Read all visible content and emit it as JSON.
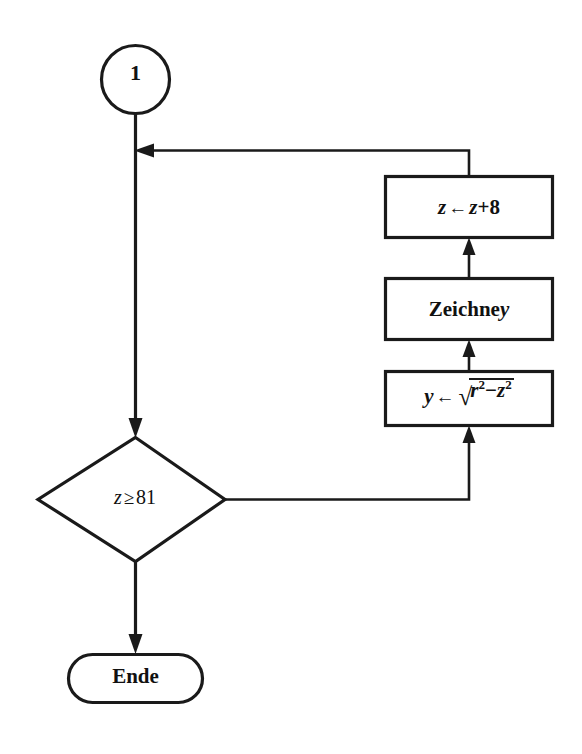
{
  "diagram": {
    "language": "de",
    "stroke_color": "#1a1a1a",
    "fill_color": "#ffffff",
    "nodes": {
      "connector": {
        "shape": "circle",
        "label": "1"
      },
      "increment": {
        "shape": "process",
        "target": "z",
        "arrow": "←",
        "operand_a": "z",
        "operator": "+",
        "operand_b": "8"
      },
      "draw": {
        "shape": "process",
        "verb": "Zeichne",
        "variable": "y"
      },
      "sqrt": {
        "shape": "process",
        "target": "y",
        "arrow": "←",
        "radical": "√",
        "base_a": "r",
        "exp_a": "2",
        "minus": "−",
        "base_b": "z",
        "exp_b": "2"
      },
      "decision": {
        "shape": "diamond",
        "variable": "z",
        "comparator": "≥",
        "value": "81"
      },
      "terminator": {
        "shape": "stadium",
        "label": "Ende"
      }
    }
  }
}
